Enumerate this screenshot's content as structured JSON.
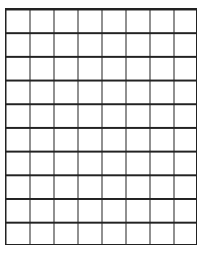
{
  "grid": {
    "columns": 8,
    "rows": 10,
    "line_color": "#222222",
    "background": "#ffffff"
  }
}
